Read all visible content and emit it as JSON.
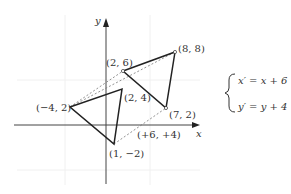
{
  "axes": {
    "x_label": "x",
    "y_label": "y"
  },
  "points": {
    "A": {
      "label": "(−4, 2)"
    },
    "B": {
      "label": "(2, 4)"
    },
    "C": {
      "label": "(1, −2)"
    },
    "A2": {
      "label": "(2, 6)"
    },
    "B2": {
      "label": "(8, 8)"
    },
    "C2": {
      "label": "(7, 2)"
    }
  },
  "translation_label": "(+6, +4)",
  "equations": {
    "line1": "x′ = x + 6",
    "line2": "y′ = y + 4"
  }
}
